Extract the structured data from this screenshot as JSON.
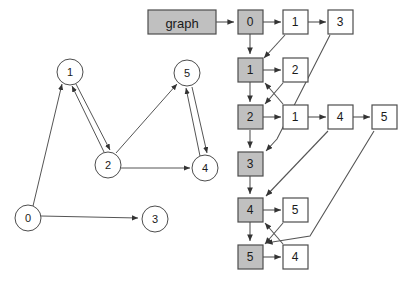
{
  "figure": {
    "kind": "graph-and-adjacency-list-diagram",
    "background_color": "#ffffff",
    "outline_color": "#4d4d4d",
    "edge_color": "#555555",
    "gray_fill": "#c0c0c0",
    "white_fill": "#ffffff"
  },
  "graph": {
    "root_label": "graph",
    "nodes": [
      {
        "id": "n0",
        "label": "0",
        "cx": 28,
        "cy": 218,
        "r": 13
      },
      {
        "id": "n1",
        "label": "1",
        "cx": 70,
        "cy": 72,
        "r": 13
      },
      {
        "id": "n2",
        "label": "2",
        "cx": 108,
        "cy": 165,
        "r": 13
      },
      {
        "id": "n3",
        "label": "3",
        "cx": 155,
        "cy": 219,
        "r": 13
      },
      {
        "id": "n4",
        "label": "4",
        "cx": 205,
        "cy": 168,
        "r": 13
      },
      {
        "id": "n5",
        "label": "5",
        "cx": 187,
        "cy": 73,
        "r": 13
      }
    ],
    "edges": [
      {
        "from": "0",
        "to": "1"
      },
      {
        "from": "0",
        "to": "3"
      },
      {
        "from": "1",
        "to": "2"
      },
      {
        "from": "2",
        "to": "1"
      },
      {
        "from": "2",
        "to": "5"
      },
      {
        "from": "2",
        "to": "4"
      },
      {
        "from": "4",
        "to": "5"
      },
      {
        "from": "5",
        "to": "4"
      }
    ]
  },
  "adjacency_list": {
    "header_label": "graph",
    "rows": [
      {
        "index": "0",
        "neighbors": [
          "1",
          "3"
        ]
      },
      {
        "index": "1",
        "neighbors": [
          "2"
        ]
      },
      {
        "index": "2",
        "neighbors": [
          "1",
          "4",
          "5"
        ]
      },
      {
        "index": "3",
        "neighbors": []
      },
      {
        "index": "4",
        "neighbors": [
          "5"
        ]
      },
      {
        "index": "5",
        "neighbors": [
          "4"
        ]
      }
    ],
    "back_references": [
      {
        "from_row": "0",
        "from_cell": "1",
        "to_row": "1"
      },
      {
        "from_row": "0",
        "from_cell": "3",
        "to_row": "3"
      },
      {
        "from_row": "1",
        "from_cell": "2",
        "to_row": "2"
      },
      {
        "from_row": "2",
        "from_cell": "1",
        "to_row": "1"
      },
      {
        "from_row": "2",
        "from_cell": "4",
        "to_row": "4"
      },
      {
        "from_row": "2",
        "from_cell": "5",
        "to_row": "5"
      },
      {
        "from_row": "4",
        "from_cell": "5",
        "to_row": "5"
      },
      {
        "from_row": "5",
        "from_cell": "4",
        "to_row": "4"
      }
    ]
  }
}
